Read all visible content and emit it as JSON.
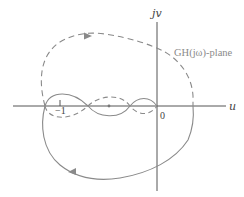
{
  "diagram": {
    "plane_label": "GH(jω)-plane",
    "axes": {
      "horizontal_label": "u",
      "vertical_label": "jv",
      "origin_label": "0",
      "tick_label": "−1"
    },
    "curves": [
      {
        "name": "positive-frequency",
        "style": "solid",
        "direction": "counterclockwise arrow pointing left at bottom"
      },
      {
        "name": "negative-frequency",
        "style": "dashed",
        "direction": "arrow pointing right at top"
      }
    ],
    "colors": {
      "axis": "#555555",
      "curve": "#8a8a8a",
      "text": "#444444",
      "plane_label": "#8a8a8a"
    }
  }
}
